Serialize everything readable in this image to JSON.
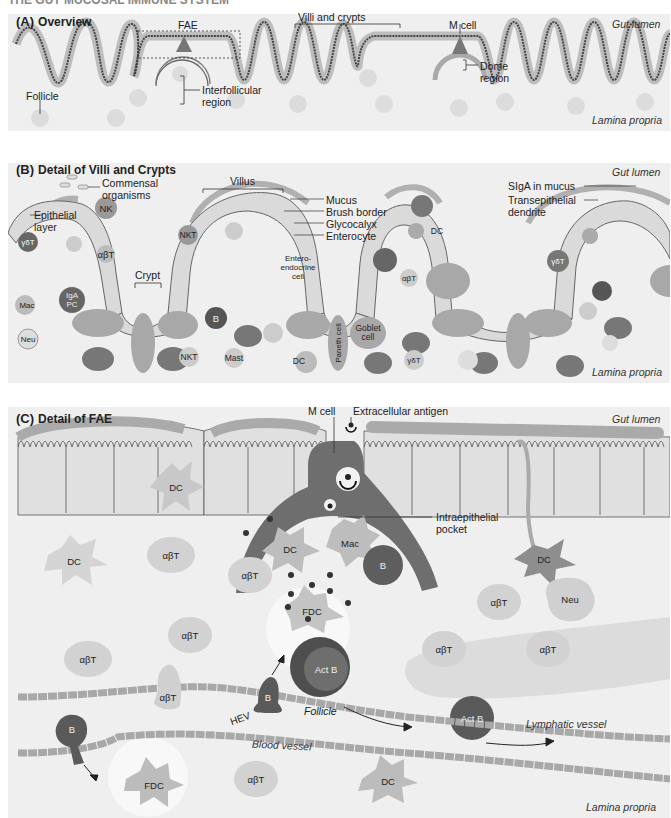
{
  "header_fragment": "THE GUT MUCOSAL IMMUNE SYSTEM",
  "colors": {
    "panel_bg": "#efefef",
    "epithelium": "#d8d8d8",
    "cell_outline": "#555555",
    "mucus": "#a8a8a8",
    "dark_cell": "#5a5a5a",
    "mid_cell": "#9a9a9a",
    "light_cell": "#cfcfcf"
  },
  "panelA": {
    "letter": "(A)",
    "title": "Overview",
    "labels": {
      "fae": "FAE",
      "villi_crypts": "Villi and crypts",
      "m_cell": "M cell",
      "gut_lumen": "Gut lumen",
      "follicle": "Follicle",
      "interfollicular_1": "Interfollicular",
      "interfollicular_2": "region",
      "dome_1": "Dome",
      "dome_2": "region",
      "lamina_propria": "Lamina propria"
    }
  },
  "panelB": {
    "letter": "(B)",
    "title": "Detail of Villi and Crypts",
    "labels": {
      "gut_lumen": "Gut lumen",
      "commensal_1": "Commensal",
      "commensal_2": "organisms",
      "villus": "Villus",
      "mucus": "Mucus",
      "brush_border": "Brush border",
      "glycocalyx": "Glycocalyx",
      "enterocyte": "Enterocyte",
      "epithelial_1": "Epithelial",
      "epithelial_2": "layer",
      "crypt": "Crypt",
      "sIgA": "SIgA in mucus",
      "transepithelial_1": "Transepithelial",
      "transepithelial_2": "dendrite",
      "lamina_propria": "Lamina propria"
    },
    "cells": {
      "gdT1": "γδT",
      "nk": "NK",
      "abT1": "αβT",
      "mac": "Mac",
      "igapc_1": "IgA",
      "igapc_2": "PC",
      "neu": "Neu",
      "nkt1": "NKT",
      "nkt2": "NKT",
      "b": "B",
      "mast": "Mast",
      "dc1": "DC",
      "entero_1": "Entero-",
      "entero_2": "endocrine",
      "entero_3": "cell",
      "paneth": "Paneth cell",
      "goblet_1": "Goblet",
      "goblet_2": "cell",
      "dc2": "DC",
      "abT2": "αβT",
      "gdT2": "γδT",
      "gdT3": "γδT"
    }
  },
  "panelC": {
    "letter": "(C)",
    "title": "Detail of FAE",
    "labels": {
      "m_cell": "M cell",
      "extracellular_antigen": "Extracellular antigen",
      "gut_lumen": "Gut lumen",
      "intraepithelial_1": "Intraepithelial",
      "intraepithelial_2": "pocket",
      "follicle": "Follicle",
      "hev": "HEV",
      "lymphatic": "Lymphatic vessel",
      "blood_vessel": "Blood vessel",
      "lamina_propria": "Lamina propria"
    },
    "cells": {
      "dc_epi": "DC",
      "dc_right": "DC",
      "dc_left": "DC",
      "dc_pocket": "DC",
      "mac": "Mac",
      "b_pocket": "B",
      "fdc": "FDC",
      "actb": "Act B",
      "abT1": "αβT",
      "abT2": "αβT",
      "abT3": "αβT",
      "abT4": "αβT",
      "abT5": "αβT",
      "abT6": "αβT",
      "abT7": "αβT",
      "abT_hev": "αβT",
      "neu": "Neu",
      "b_hev": "B",
      "actb_lymph": "Act B",
      "b_blood": "B",
      "fdc_bottom": "FDC",
      "abT_bottom": "αβT",
      "dc_bottom": "DC"
    }
  }
}
